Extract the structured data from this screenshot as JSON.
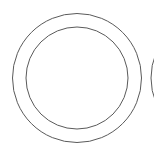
{
  "figure": {
    "background": "#ffffff",
    "stroke_color": "#5a5a5a",
    "shapes": [
      {
        "name": "outer-ring",
        "cx": 77,
        "cy": 78,
        "r": 64.5,
        "stroke_width": 1
      },
      {
        "name": "inner-ring",
        "cx": 77,
        "cy": 78,
        "r": 51,
        "stroke_width": 1
      },
      {
        "name": "adjacent-ring-partial",
        "cx": 215.5,
        "cy": 78,
        "r": 64.5,
        "stroke_width": 1
      }
    ]
  }
}
